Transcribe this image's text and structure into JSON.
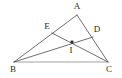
{
  "figure": {
    "background_color": "#ffffff",
    "line_color": "#4a4a4a",
    "label_color": "#2b2b2b",
    "points": {
      "A": {
        "label": "A",
        "x": 77,
        "y": 15,
        "label_x": 77,
        "label_y": 7
      },
      "B": {
        "label": "B",
        "x": 14,
        "y": 62,
        "label_x": 13,
        "label_y": 70
      },
      "C": {
        "label": "C",
        "x": 108,
        "y": 62,
        "label_x": 109,
        "label_y": 70
      },
      "D": {
        "label": "D",
        "x": 93,
        "y": 37,
        "label_x": 97,
        "label_y": 30
      },
      "E": {
        "label": "E",
        "x": 52,
        "y": 33,
        "label_x": 47,
        "label_y": 27
      },
      "I": {
        "label": "I",
        "x": 72,
        "y": 42,
        "label_x": 71,
        "label_y": 51
      }
    },
    "segments": [
      {
        "name": "segment-AB",
        "from": "A",
        "to": "B"
      },
      {
        "name": "segment-AC",
        "from": "A",
        "to": "C"
      },
      {
        "name": "segment-BC",
        "from": "B",
        "to": "C"
      },
      {
        "name": "segment-BD",
        "from": "B",
        "to": "D"
      },
      {
        "name": "segment-CE",
        "from": "C",
        "to": "E"
      }
    ],
    "marked_point": "I"
  }
}
